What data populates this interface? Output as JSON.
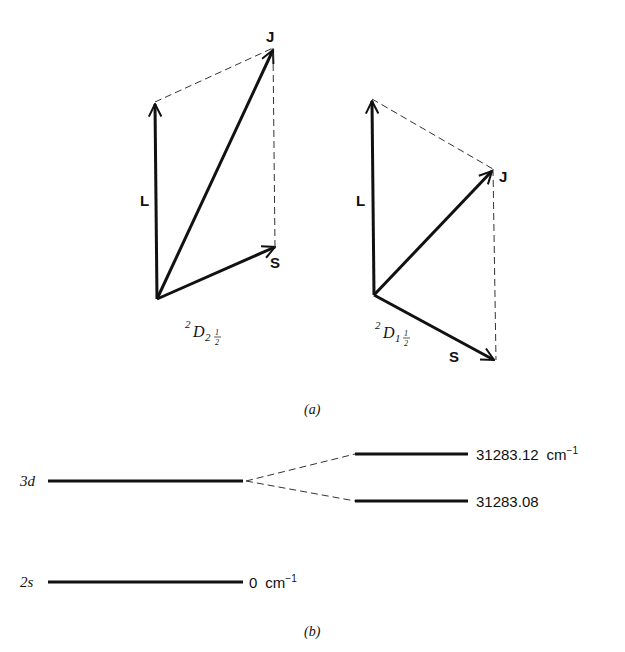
{
  "panel_a": {
    "caption": "(a)",
    "left_diagram": {
      "state_label": {
        "sup": "2",
        "main": "D",
        "sub": "2",
        "frac_num": "1",
        "frac_den": "2"
      },
      "vectors": {
        "L": "L",
        "S": "S",
        "J": "J"
      }
    },
    "right_diagram": {
      "state_label": {
        "sup": "2",
        "main": "D",
        "sub": "1",
        "frac_num": "1",
        "frac_den": "2"
      },
      "vectors": {
        "L": "L",
        "S": "S",
        "J": "J"
      }
    }
  },
  "panel_b": {
    "caption": "(b)",
    "levels": {
      "upper": {
        "label": "3d"
      },
      "split_high": {
        "value": "31283.12",
        "unit": "cm",
        "unit_exp": "−1"
      },
      "split_low": {
        "value": "31283.08"
      },
      "ground": {
        "label": "2s",
        "value": "0",
        "unit": "cm",
        "unit_exp": "−1"
      }
    }
  }
}
